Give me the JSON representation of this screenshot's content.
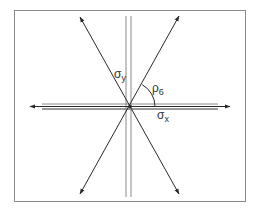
{
  "diagram": {
    "type": "stress-axes-diagram",
    "frame": {
      "x": 14,
      "y": 10,
      "width": 231,
      "height": 191,
      "stroke": "#8a8a8a"
    },
    "center": {
      "x": 130,
      "y": 107
    },
    "colors": {
      "line": "#2a2a2a",
      "double_line": "#8a8a8a",
      "frame": "#8a8a8a",
      "text": "#333333"
    },
    "labels": {
      "sigma_y": {
        "base": "σ",
        "sub": "y"
      },
      "rho_6": {
        "base": "ρ",
        "sub": "6"
      },
      "sigma_x": {
        "base": "σ",
        "sub": "x"
      }
    },
    "elements": [
      {
        "name": "horizontal-axis-arrow",
        "from": [
          30,
          107
        ],
        "to": [
          230,
          107
        ],
        "arrowheads": "both"
      },
      {
        "name": "horizontal-double-line",
        "offset_px": 3
      },
      {
        "name": "vertical-double-line",
        "x": [
          126,
          131
        ],
        "y_range": [
          16,
          197
        ]
      },
      {
        "name": "diagonal-line-1",
        "from": [
          80,
          17
        ],
        "to": [
          179,
          194
        ],
        "arrowheads": "both"
      },
      {
        "name": "diagonal-line-2",
        "from": [
          179,
          16
        ],
        "to": [
          80,
          194
        ],
        "arrowheads": "both"
      },
      {
        "name": "angle-arc",
        "radius": 25,
        "between": [
          "diagonal-line-2",
          "horizontal-axis"
        ]
      }
    ]
  }
}
